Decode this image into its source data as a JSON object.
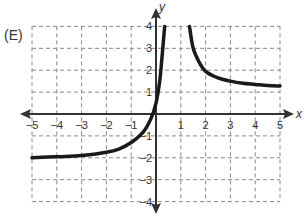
{
  "panel_label": "(E)",
  "chart_data": {
    "type": "line",
    "title": "",
    "xlabel": "x",
    "ylabel": "y",
    "xlim": [
      -5,
      5
    ],
    "ylim": [
      -4,
      4
    ],
    "grid": true,
    "grid_style": "dashed",
    "x_ticks": [
      -5,
      -4,
      -3,
      -2,
      -1,
      1,
      2,
      3,
      4,
      5
    ],
    "y_ticks": [
      -4,
      -3,
      -2,
      -1,
      1,
      2,
      3,
      4
    ],
    "asymptotes_visual": {
      "left_branch_horizontal": -2,
      "right_branch_horizontal": 1,
      "vertical_region": [
        0.4,
        1.3
      ]
    },
    "series": [
      {
        "name": "left-branch",
        "x": [
          -5,
          -4,
          -3,
          -2,
          -1.5,
          -1,
          -0.5,
          -0.2,
          0,
          0.15,
          0.25,
          0.35
        ],
        "y": [
          -2.0,
          -1.95,
          -1.9,
          -1.75,
          -1.6,
          -1.3,
          -0.8,
          -0.2,
          0.5,
          1.5,
          2.7,
          4.0
        ]
      },
      {
        "name": "right-branch",
        "x": [
          1.35,
          1.5,
          1.75,
          2,
          2.5,
          3,
          3.5,
          4,
          4.5,
          5
        ],
        "y": [
          4.0,
          3.0,
          2.35,
          1.95,
          1.65,
          1.5,
          1.4,
          1.35,
          1.3,
          1.28
        ]
      }
    ],
    "colors": {
      "curve": "#1a1a1a",
      "axis": "#333333",
      "grid": "#888888"
    }
  }
}
